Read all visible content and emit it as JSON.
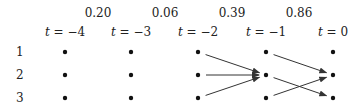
{
  "columns": [
    {
      "t": "-4",
      "label_var": "t",
      "label_value": "= −4",
      "x": 65
    },
    {
      "t": "-3",
      "label_var": "t",
      "label_value": "= −3",
      "x": 131
    },
    {
      "t": "-2",
      "label_var": "t",
      "label_value": "= −2",
      "x": 198
    },
    {
      "t": "-1",
      "label_var": "t",
      "label_value": "= −1",
      "x": 266
    },
    {
      "t": "0",
      "label_var": "t",
      "label_value": "= 0",
      "x": 333
    }
  ],
  "weights": [
    {
      "value": "0.20",
      "x": 98
    },
    {
      "value": "0.06",
      "x": 165
    },
    {
      "value": "0.39",
      "x": 232
    },
    {
      "value": "0.86",
      "x": 299
    }
  ],
  "rows": [
    {
      "label": "1",
      "y": 52
    },
    {
      "label": "2",
      "y": 75
    },
    {
      "label": "3",
      "y": 98
    }
  ],
  "edges": [
    {
      "from": {
        "col": 2,
        "row": 0
      },
      "to": {
        "col": 3,
        "row": 1
      }
    },
    {
      "from": {
        "col": 2,
        "row": 1
      },
      "to": {
        "col": 3,
        "row": 1
      }
    },
    {
      "from": {
        "col": 2,
        "row": 2
      },
      "to": {
        "col": 3,
        "row": 1
      }
    },
    {
      "from": {
        "col": 3,
        "row": 0
      },
      "to": {
        "col": 4,
        "row": 1
      }
    },
    {
      "from": {
        "col": 3,
        "row": 1
      },
      "to": {
        "col": 4,
        "row": 2
      }
    },
    {
      "from": {
        "col": 3,
        "row": 2
      },
      "to": {
        "col": 4,
        "row": 1
      }
    }
  ],
  "colors": {
    "node": "#111111",
    "edge": "#333333",
    "text": "#222222"
  }
}
